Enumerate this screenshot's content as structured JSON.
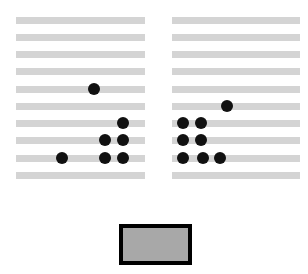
{
  "figure": {
    "title": "",
    "canvas": {
      "width": 308,
      "height": 274,
      "background": "#ffffff"
    },
    "colors": {
      "bar": "#d4d4d4",
      "dot": "#111111",
      "legend_fill": "#a8a8a8",
      "legend_border": "#000000",
      "background": "#ffffff"
    }
  },
  "chart_data": {
    "type": "scatter",
    "title": "",
    "subtitle": "",
    "xlabel": "",
    "ylabel": "",
    "grid": true,
    "legend_position": "bottom-center",
    "row_count": 10,
    "row_labels": [
      "1",
      "2",
      "3",
      "4",
      "5",
      "6",
      "7",
      "8",
      "9",
      "10"
    ],
    "row_y": [
      17,
      34,
      51,
      68,
      86,
      103,
      120,
      137,
      155,
      172
    ],
    "panels": [
      {
        "name": "left-panel",
        "x": 16,
        "width": 129,
        "rows": [
          {
            "row": 1,
            "y": 17,
            "dots": []
          },
          {
            "row": 2,
            "y": 34,
            "dots": []
          },
          {
            "row": 3,
            "y": 51,
            "dots": []
          },
          {
            "row": 4,
            "y": 68,
            "dots": []
          },
          {
            "row": 5,
            "y": 86,
            "dots": [
              94
            ]
          },
          {
            "row": 6,
            "y": 103,
            "dots": []
          },
          {
            "row": 7,
            "y": 120,
            "dots": [
              123
            ]
          },
          {
            "row": 8,
            "y": 137,
            "dots": [
              105,
              123
            ]
          },
          {
            "row": 9,
            "y": 155,
            "dots": [
              62,
              105,
              123
            ]
          },
          {
            "row": 10,
            "y": 172,
            "dots": []
          }
        ],
        "dot_count": 7
      },
      {
        "name": "right-panel",
        "x": 172,
        "width": 128,
        "rows": [
          {
            "row": 1,
            "y": 17,
            "dots": []
          },
          {
            "row": 2,
            "y": 34,
            "dots": []
          },
          {
            "row": 3,
            "y": 51,
            "dots": []
          },
          {
            "row": 4,
            "y": 68,
            "dots": []
          },
          {
            "row": 5,
            "y": 86,
            "dots": []
          },
          {
            "row": 6,
            "y": 103,
            "dots": [
              227
            ]
          },
          {
            "row": 7,
            "y": 120,
            "dots": [
              183,
              201
            ]
          },
          {
            "row": 8,
            "y": 137,
            "dots": [
              183,
              201
            ]
          },
          {
            "row": 9,
            "y": 155,
            "dots": [
              183,
              203,
              220
            ]
          },
          {
            "row": 10,
            "y": 172,
            "dots": []
          }
        ],
        "dot_count": 8
      }
    ],
    "dot_radius": 6,
    "legend": {
      "label": "",
      "x": 119,
      "y": 224,
      "width": 73,
      "height": 41,
      "fill": "#a8a8a8",
      "border": "#000000",
      "border_width": 4
    }
  }
}
